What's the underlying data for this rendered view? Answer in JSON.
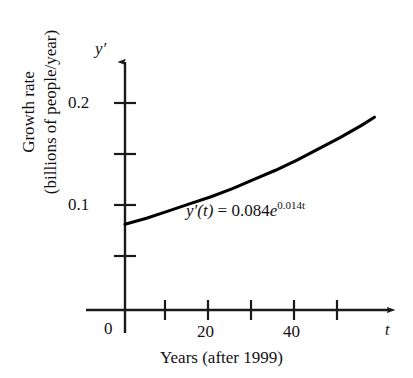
{
  "chart_data": {
    "type": "line",
    "title": "",
    "subtitle": "",
    "xlabel": "Years (after 1999)",
    "ylabel": "Growth rate (billions of people/year)",
    "ylabel_line1": "Growth rate",
    "ylabel_line2": "(billions of people/year)",
    "x_axis_symbol": "t",
    "y_axis_symbol": "y′",
    "xlim": [
      0,
      60
    ],
    "ylim": [
      0,
      0.225
    ],
    "xticks": [
      0,
      10,
      20,
      30,
      40,
      50
    ],
    "xtick_labels": [
      "0",
      "",
      "20",
      "",
      "40",
      ""
    ],
    "yticks": [
      0.05,
      0.1,
      0.15,
      0.2
    ],
    "ytick_labels": [
      "",
      "0.1",
      "",
      "0.2"
    ],
    "grid": false,
    "legend": "none",
    "annotation": {
      "text": "y′(t) = 0.084e^{0.014t}",
      "func_name": "y′",
      "arg": "(t)",
      "equals": " = ",
      "coefficient": "0.084",
      "base": "e",
      "exponent": "0.014t"
    },
    "equation": {
      "amplitude": 0.084,
      "rate": 0.014,
      "form": "y'(t) = 0.084*exp(0.014*t)"
    },
    "series": [
      {
        "name": "y'(t) = 0.084e^{0.014t}",
        "color": "#000000",
        "x": [
          0,
          5,
          10,
          15,
          20,
          25,
          30,
          35,
          40,
          45,
          50,
          55,
          58
        ],
        "values": [
          0.084,
          0.09,
          0.097,
          0.104,
          0.111,
          0.119,
          0.128,
          0.137,
          0.147,
          0.158,
          0.169,
          0.181,
          0.189
        ]
      }
    ]
  },
  "figure": {
    "background": "#ffffff",
    "axis_color": "#1a1a1a",
    "curve_color": "#000000"
  }
}
